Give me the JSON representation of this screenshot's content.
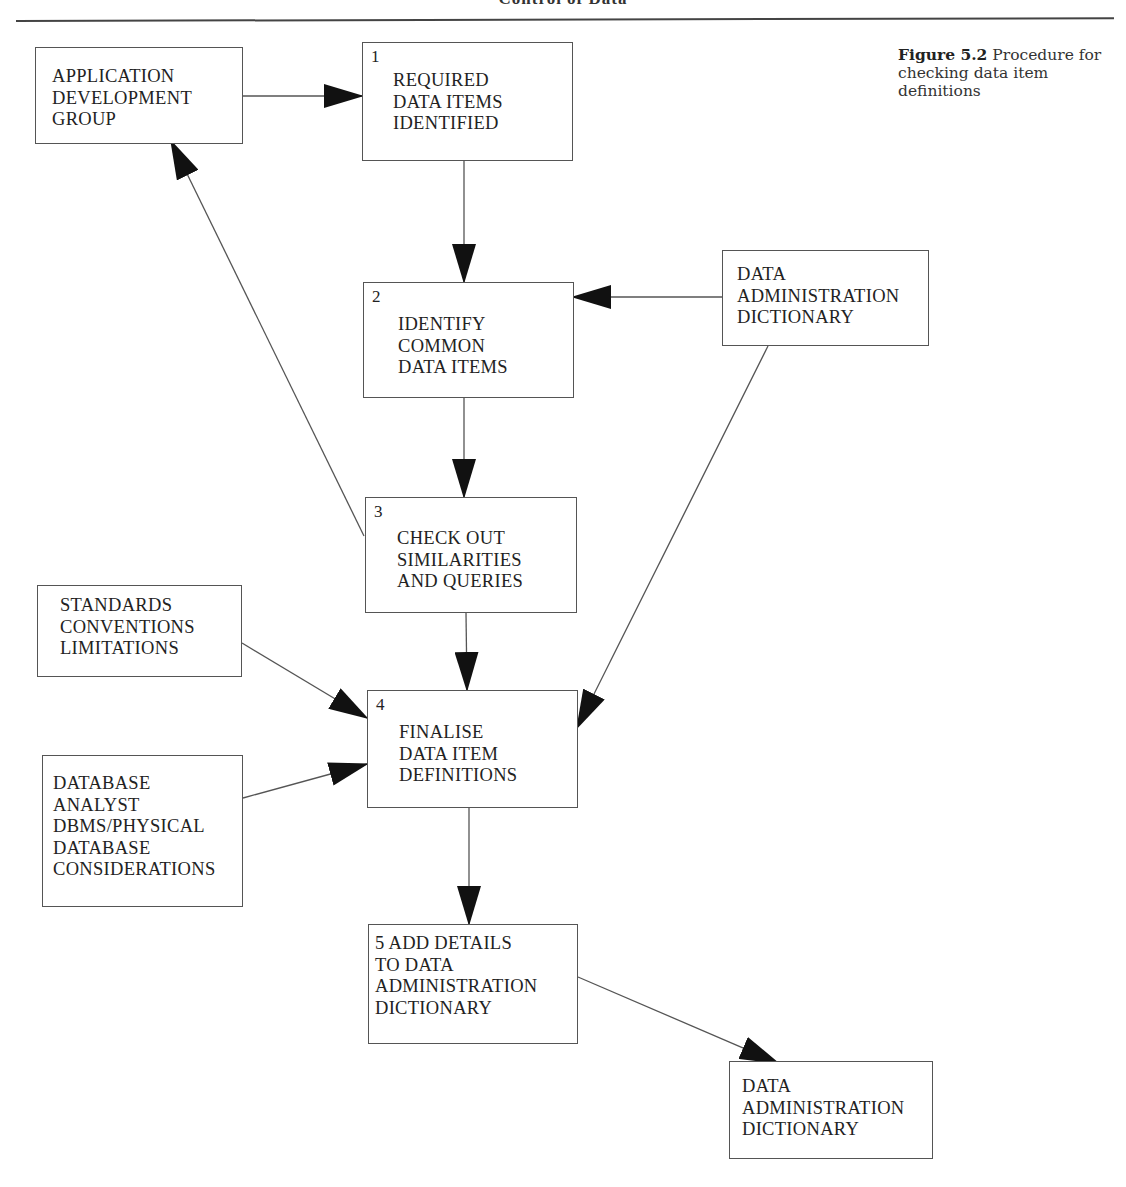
{
  "page": {
    "running_head": "Control of Data",
    "caption": {
      "figure_number": "Figure 5.2",
      "text": " Procedure for checking data item definitions"
    }
  },
  "boxes": {
    "app_dev_group": {
      "number": "",
      "lines": "APPLICATION\nDEVELOPMENT\nGROUP"
    },
    "step1": {
      "number": "1",
      "lines": "REQUIRED\nDATA ITEMS\nIDENTIFIED"
    },
    "step2": {
      "number": "2",
      "lines": "IDENTIFY\nCOMMON\nDATA ITEMS"
    },
    "dad_top": {
      "number": "",
      "lines": "DATA\nADMINISTRATION\nDICTIONARY"
    },
    "step3": {
      "number": "3",
      "lines": "CHECK OUT\nSIMILARITIES\nAND QUERIES"
    },
    "standards": {
      "number": "",
      "lines": "STANDARDS\nCONVENTIONS\nLIMITATIONS"
    },
    "step4": {
      "number": "4",
      "lines": "FINALISE\nDATA ITEM\nDEFINITIONS"
    },
    "dba": {
      "number": "",
      "lines": "DATABASE\nANALYST\nDBMS/PHYSICAL\nDATABASE\nCONSIDERATIONS"
    },
    "step5": {
      "number": "5",
      "lines": "ADD DETAILS\n TO DATA\n ADMINISTRATION\n DICTIONARY"
    },
    "dad_bottom": {
      "number": "",
      "lines": "DATA\nADMINISTRATION\nDICTIONARY"
    }
  },
  "edges": [
    {
      "from": "APPLICATION DEVELOPMENT GROUP",
      "to": "1 REQUIRED DATA ITEMS IDENTIFIED"
    },
    {
      "from": "1 REQUIRED DATA ITEMS IDENTIFIED",
      "to": "2 IDENTIFY COMMON DATA ITEMS"
    },
    {
      "from": "DATA ADMINISTRATION DICTIONARY (top)",
      "to": "2 IDENTIFY COMMON DATA ITEMS"
    },
    {
      "from": "2 IDENTIFY COMMON DATA ITEMS",
      "to": "3 CHECK OUT SIMILARITIES AND QUERIES"
    },
    {
      "from": "3 CHECK OUT SIMILARITIES AND QUERIES",
      "to": "APPLICATION DEVELOPMENT GROUP"
    },
    {
      "from": "3 CHECK OUT SIMILARITIES AND QUERIES",
      "to": "4 FINALISE DATA ITEM DEFINITIONS"
    },
    {
      "from": "DATA ADMINISTRATION DICTIONARY (top)",
      "to": "4 FINALISE DATA ITEM DEFINITIONS"
    },
    {
      "from": "STANDARDS CONVENTIONS LIMITATIONS",
      "to": "4 FINALISE DATA ITEM DEFINITIONS"
    },
    {
      "from": "DATABASE ANALYST DBMS/PHYSICAL DATABASE CONSIDERATIONS",
      "to": "4 FINALISE DATA ITEM DEFINITIONS"
    },
    {
      "from": "4 FINALISE DATA ITEM DEFINITIONS",
      "to": "5 ADD DETAILS TO DATA ADMINISTRATION DICTIONARY"
    },
    {
      "from": "5 ADD DETAILS TO DATA ADMINISTRATION DICTIONARY",
      "to": "DATA ADMINISTRATION DICTIONARY (bottom)"
    }
  ],
  "colors": {
    "line": "#555555",
    "arrowhead": "#111111",
    "text": "#222222",
    "background": "#ffffff"
  }
}
